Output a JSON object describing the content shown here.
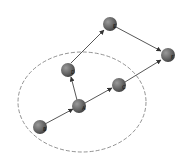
{
  "diagram": {
    "nodes": [
      {
        "id": "B",
        "label": "B",
        "x": 40,
        "y": 127
      },
      {
        "id": "A",
        "label": "A",
        "x": 79,
        "y": 106
      },
      {
        "id": "D",
        "label": "D",
        "x": 68,
        "y": 70
      },
      {
        "id": "E",
        "label": "E",
        "x": 110,
        "y": 24
      },
      {
        "id": "C",
        "label": "C",
        "x": 119,
        "y": 85
      },
      {
        "id": "F",
        "label": "F",
        "x": 168,
        "y": 55
      }
    ],
    "edges": [
      {
        "from": "B",
        "to": "A"
      },
      {
        "from": "A",
        "to": "D"
      },
      {
        "from": "A",
        "to": "C"
      },
      {
        "from": "D",
        "to": "E"
      },
      {
        "from": "E",
        "to": "F"
      },
      {
        "from": "C",
        "to": "F"
      }
    ],
    "region": {
      "shape": "dashed-ellipse",
      "cx": 82,
      "cy": 102,
      "rx": 64,
      "ry": 50
    },
    "colors": {
      "node_fill": "#6b6b6b",
      "edge": "#444444",
      "region_stroke": "#777777"
    }
  }
}
